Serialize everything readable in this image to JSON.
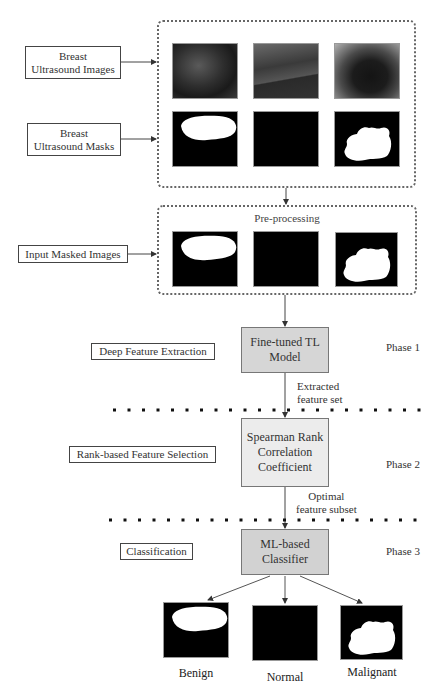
{
  "inputs": {
    "ultrasound_images": [
      "Breast",
      "Ultrasound Images"
    ],
    "ultrasound_masks": [
      "Breast",
      "Ultrasound Masks"
    ],
    "masked_images": "Input Masked Images"
  },
  "preprocessing": {
    "title": "Pre-processing"
  },
  "phases": [
    {
      "stage_label": "Deep Feature Extraction",
      "process": [
        "Fine-tuned TL",
        "Model"
      ],
      "phase_label": "Phase 1",
      "output_note": [
        "Extracted",
        "feature set"
      ]
    },
    {
      "stage_label": "Rank-based Feature Selection",
      "process": [
        "Spearman Rank",
        "Correlation",
        "Coefficient"
      ],
      "phase_label": "Phase 2",
      "output_note": [
        "Optimal",
        "feature subset"
      ]
    },
    {
      "stage_label": "Classification",
      "process": [
        "ML-based",
        "Classifier"
      ],
      "phase_label": "Phase 3"
    }
  ],
  "outputs": [
    "Benign",
    "Normal",
    "Malignant"
  ],
  "colors": {
    "process_box_1": "#d6d6d6",
    "process_box_2": "#ececec",
    "process_box_3": "#d2d2d2",
    "line": "#444444",
    "mask_bg": "#000000",
    "mask_fg": "#ffffff"
  }
}
